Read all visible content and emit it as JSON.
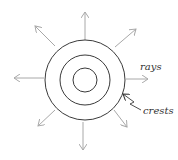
{
  "diagram": {
    "colors": {
      "circle": "#3a3a3a",
      "ray": "#a8a8a8",
      "label": "#333333",
      "background": "#ffffff"
    },
    "center": {
      "x": 85,
      "y": 80
    },
    "circles": [
      {
        "name": "outer-crest",
        "r": 40
      },
      {
        "name": "middle-crest",
        "r": 25
      },
      {
        "name": "inner-crest",
        "r": 12
      }
    ],
    "rays": [
      {
        "direction": "up",
        "x1": 85,
        "y1": 40,
        "x2": 85,
        "y2": 12
      },
      {
        "direction": "up-right",
        "x1": 115,
        "y1": 47,
        "x2": 136,
        "y2": 29
      },
      {
        "direction": "right",
        "x1": 126,
        "y1": 79,
        "x2": 148,
        "y2": 79
      },
      {
        "direction": "down-right",
        "x1": 114,
        "y1": 110,
        "x2": 127,
        "y2": 127
      },
      {
        "direction": "down",
        "x1": 83,
        "y1": 122,
        "x2": 83,
        "y2": 150
      },
      {
        "direction": "down-left",
        "x1": 55,
        "y1": 110,
        "x2": 38,
        "y2": 126
      },
      {
        "direction": "left",
        "x1": 44,
        "y1": 78,
        "x2": 14,
        "y2": 78
      },
      {
        "direction": "up-left",
        "x1": 55,
        "y1": 46,
        "x2": 35,
        "y2": 26
      }
    ],
    "labels": {
      "rays": "rays",
      "crests": "crests"
    }
  }
}
